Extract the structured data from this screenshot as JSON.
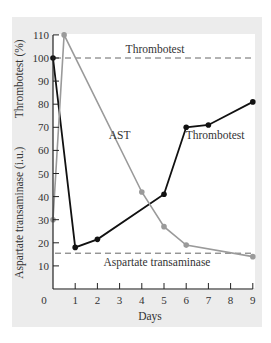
{
  "chart_data": {
    "type": "line",
    "title": "",
    "xlabel": "Days",
    "ylabel_upper": "Thrombotest (%)",
    "ylabel_lower": "Aspartate transaminase (i.u.)",
    "xlim": [
      0,
      9
    ],
    "ylim": [
      0,
      110
    ],
    "x_ticks": [
      0,
      1,
      2,
      3,
      4,
      5,
      6,
      7,
      8,
      9
    ],
    "y_ticks": [
      10,
      20,
      30,
      40,
      50,
      60,
      70,
      80,
      90,
      100,
      110
    ],
    "grid": false,
    "series": [
      {
        "name": "Thrombotest",
        "color": "#111111",
        "x": [
          0,
          1,
          2,
          5,
          6,
          7,
          9
        ],
        "values": [
          100,
          18,
          21.5,
          41,
          70,
          71,
          81
        ]
      },
      {
        "name": "AST",
        "color": "#9a9a9a",
        "x": [
          0,
          0.5,
          4,
          5,
          6,
          9
        ],
        "values": [
          30,
          110,
          42,
          27,
          19,
          14
        ]
      }
    ],
    "reference_lines": [
      {
        "name": "Thrombotest",
        "y": 100,
        "style": "dashed",
        "label": "Thrombotest"
      },
      {
        "name": "Aspartate transaminase",
        "y": 15.5,
        "style": "dashed",
        "label": "Aspartate transaminase"
      }
    ],
    "annotations": [
      {
        "text": "AST",
        "x": 3.0,
        "y": 65
      },
      {
        "text": "Thrombotest",
        "x": 7.3,
        "y": 65
      }
    ]
  },
  "colors": {
    "panel_bg": "#ececec",
    "plot_bg": "#ffffff",
    "axis": "#222222"
  }
}
